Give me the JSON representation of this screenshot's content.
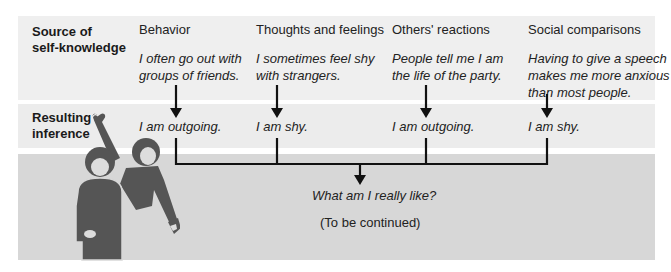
{
  "rows": {
    "source_label": [
      "Source of",
      "self-knowledge"
    ],
    "inference_label": [
      "Resulting",
      "inference"
    ]
  },
  "columns": [
    {
      "heading": "Behavior",
      "example": [
        "I often go out with",
        "groups of friends."
      ],
      "inference": "I am outgoing."
    },
    {
      "heading": "Thoughts and feelings",
      "example": [
        "I sometimes feel shy",
        "with strangers."
      ],
      "inference": "I am shy."
    },
    {
      "heading": "Others' reactions",
      "example": [
        "People tell me I am",
        "the life of the party."
      ],
      "inference": "I am outgoing."
    },
    {
      "heading": "Social comparisons",
      "example": [
        "Having to give a speech",
        "makes me more anxious",
        "than most people."
      ],
      "inference": "I am shy."
    }
  ],
  "conclusion": {
    "question": "What am I really like?",
    "note": "(To be continued)"
  },
  "illustration": {
    "icon": "two-people-figure-icon"
  },
  "colors": {
    "band_top": "#efefef",
    "band_middle": "#ececec",
    "band_bottom": "#d7d7d7",
    "figure": "#555555",
    "lines": "#111111"
  }
}
